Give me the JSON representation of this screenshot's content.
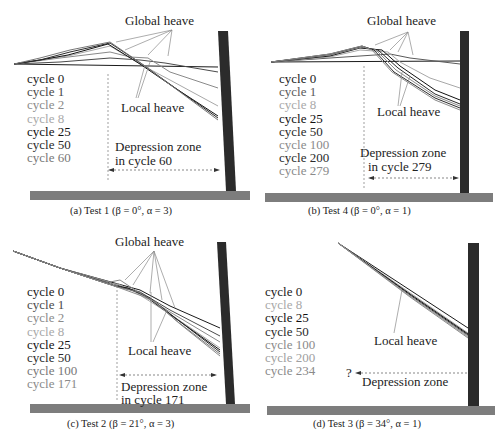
{
  "figure": {
    "panels": [
      {
        "id": "a",
        "caption": "(a) Test 1 (β = 0°, α = 3)",
        "global_label": "Global heave",
        "local_label": "Local heave",
        "depression_label": [
          "Depression zone",
          "in cycle 60"
        ],
        "legend": [
          {
            "text": "cycle 0",
            "color": "#1a1a1a"
          },
          {
            "text": "cycle 1",
            "color": "#4a4a4a"
          },
          {
            "text": "cycle 2",
            "color": "#8a8a8a"
          },
          {
            "text": "cycle 8",
            "color": "#a8a8a8"
          },
          {
            "text": "cycle 25",
            "color": "#111111"
          },
          {
            "text": "cycle 50",
            "color": "#2a2a2a"
          },
          {
            "text": "cycle 60",
            "color": "#777777"
          }
        ]
      },
      {
        "id": "b",
        "caption": "(b) Test 4 (β = 0°, α = 1)",
        "global_label": "Global heave",
        "local_label": "Local heave",
        "depression_label": [
          "Depression zone",
          "in cycle 279"
        ],
        "legend": [
          {
            "text": "cycle 0",
            "color": "#1a1a1a"
          },
          {
            "text": "cycle 1",
            "color": "#5a5a5a"
          },
          {
            "text": "cycle 8",
            "color": "#a8a8a8"
          },
          {
            "text": "cycle 25",
            "color": "#111111"
          },
          {
            "text": "cycle 50",
            "color": "#2a2a2a"
          },
          {
            "text": "cycle 100",
            "color": "#8a8a8a"
          },
          {
            "text": "cycle 200",
            "color": "#2a2a2a"
          },
          {
            "text": "cycle 279",
            "color": "#8a8a8a"
          }
        ]
      },
      {
        "id": "c",
        "caption": "(c) Test 2 (β = 21°, α = 3)",
        "global_label": "Global heave",
        "local_label": "Local heave",
        "depression_label": [
          "Depression zone",
          "in cycle 171"
        ],
        "legend": [
          {
            "text": "cycle 0",
            "color": "#1a1a1a"
          },
          {
            "text": "cycle 1",
            "color": "#4a4a4a"
          },
          {
            "text": "cycle 2",
            "color": "#8a8a8a"
          },
          {
            "text": "cycle 8",
            "color": "#a8a8a8"
          },
          {
            "text": "cycle 25",
            "color": "#111111"
          },
          {
            "text": "cycle 50",
            "color": "#2a2a2a"
          },
          {
            "text": "cycle 100",
            "color": "#777777"
          },
          {
            "text": "cycle 171",
            "color": "#8a8a8a"
          }
        ]
      },
      {
        "id": "d",
        "caption": "(d) Test 3 (β = 34°, α = 1)",
        "global_label": "",
        "local_label": "Local heave",
        "depression_label": [
          "Depression zone"
        ],
        "question_mark": "?",
        "legend": [
          {
            "text": "cycle 0",
            "color": "#1a1a1a"
          },
          {
            "text": "cycle 8",
            "color": "#a8a8a8"
          },
          {
            "text": "cycle 25",
            "color": "#111111"
          },
          {
            "text": "cycle 50",
            "color": "#2a2a2a"
          },
          {
            "text": "cycle 100",
            "color": "#8a8a8a"
          },
          {
            "text": "cycle 200",
            "color": "#a0a0a0"
          },
          {
            "text": "cycle 234",
            "color": "#8a8a8a"
          }
        ]
      }
    ],
    "colors": {
      "wall": "#2b2b2b",
      "base": "#7d7d7d",
      "leader": "#8a8a8a",
      "dashed": "#555555"
    }
  }
}
